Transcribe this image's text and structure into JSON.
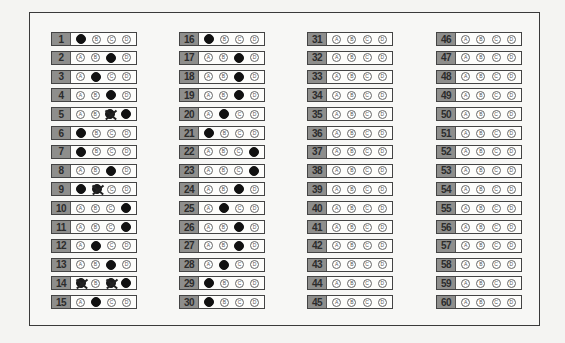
{
  "sheet": {
    "options": [
      "A",
      "B",
      "C",
      "D"
    ],
    "columns": [
      {
        "x": 51,
        "questions": [
          {
            "n": "1",
            "marks": [
              "filled",
              "",
              "",
              ""
            ]
          },
          {
            "n": "2",
            "marks": [
              "",
              "",
              "filled",
              ""
            ]
          },
          {
            "n": "3",
            "marks": [
              "",
              "filled",
              "",
              ""
            ]
          },
          {
            "n": "4",
            "marks": [
              "",
              "",
              "filled",
              ""
            ]
          },
          {
            "n": "5",
            "marks": [
              "",
              "",
              "crossed",
              "filled"
            ]
          },
          {
            "n": "6",
            "marks": [
              "filled",
              "",
              "",
              ""
            ]
          },
          {
            "n": "7",
            "marks": [
              "filled",
              "",
              "",
              ""
            ]
          },
          {
            "n": "8",
            "marks": [
              "",
              "",
              "filled",
              ""
            ]
          },
          {
            "n": "9",
            "marks": [
              "filled",
              "crossed",
              "",
              ""
            ]
          },
          {
            "n": "10",
            "marks": [
              "",
              "",
              "",
              "filled"
            ]
          },
          {
            "n": "11",
            "marks": [
              "",
              "",
              "",
              "filled"
            ]
          },
          {
            "n": "12",
            "marks": [
              "",
              "filled",
              "",
              ""
            ]
          },
          {
            "n": "13",
            "marks": [
              "",
              "",
              "filled",
              ""
            ]
          },
          {
            "n": "14",
            "marks": [
              "crossed",
              "",
              "crossed",
              "filled"
            ]
          },
          {
            "n": "15",
            "marks": [
              "",
              "filled",
              "",
              ""
            ]
          }
        ]
      },
      {
        "x": 179,
        "questions": [
          {
            "n": "16",
            "marks": [
              "filled",
              "",
              "",
              ""
            ]
          },
          {
            "n": "17",
            "marks": [
              "",
              "",
              "filled",
              ""
            ]
          },
          {
            "n": "18",
            "marks": [
              "",
              "",
              "filled",
              ""
            ]
          },
          {
            "n": "19",
            "marks": [
              "",
              "",
              "filled",
              ""
            ]
          },
          {
            "n": "20",
            "marks": [
              "",
              "filled",
              "",
              ""
            ]
          },
          {
            "n": "21",
            "marks": [
              "filled",
              "",
              "",
              ""
            ]
          },
          {
            "n": "22",
            "marks": [
              "",
              "",
              "",
              "filled"
            ]
          },
          {
            "n": "23",
            "marks": [
              "",
              "",
              "",
              "filled"
            ]
          },
          {
            "n": "24",
            "marks": [
              "",
              "",
              "filled",
              ""
            ]
          },
          {
            "n": "25",
            "marks": [
              "",
              "filled",
              "",
              ""
            ]
          },
          {
            "n": "26",
            "marks": [
              "",
              "",
              "filled",
              ""
            ]
          },
          {
            "n": "27",
            "marks": [
              "",
              "",
              "filled",
              ""
            ]
          },
          {
            "n": "28",
            "marks": [
              "",
              "filled",
              "",
              ""
            ]
          },
          {
            "n": "29",
            "marks": [
              "filled",
              "",
              "",
              ""
            ]
          },
          {
            "n": "30",
            "marks": [
              "filled",
              "",
              "",
              ""
            ]
          }
        ]
      },
      {
        "x": 307,
        "questions": [
          {
            "n": "31",
            "marks": [
              "",
              "",
              "",
              ""
            ]
          },
          {
            "n": "32",
            "marks": [
              "",
              "",
              "",
              ""
            ]
          },
          {
            "n": "33",
            "marks": [
              "",
              "",
              "",
              ""
            ]
          },
          {
            "n": "34",
            "marks": [
              "",
              "",
              "",
              ""
            ]
          },
          {
            "n": "35",
            "marks": [
              "",
              "",
              "",
              ""
            ]
          },
          {
            "n": "36",
            "marks": [
              "",
              "",
              "",
              ""
            ]
          },
          {
            "n": "37",
            "marks": [
              "",
              "",
              "",
              ""
            ]
          },
          {
            "n": "38",
            "marks": [
              "",
              "",
              "",
              ""
            ]
          },
          {
            "n": "39",
            "marks": [
              "",
              "",
              "",
              ""
            ]
          },
          {
            "n": "40",
            "marks": [
              "",
              "",
              "",
              ""
            ]
          },
          {
            "n": "41",
            "marks": [
              "",
              "",
              "",
              ""
            ]
          },
          {
            "n": "42",
            "marks": [
              "",
              "",
              "",
              ""
            ]
          },
          {
            "n": "43",
            "marks": [
              "",
              "",
              "",
              ""
            ]
          },
          {
            "n": "44",
            "marks": [
              "",
              "",
              "",
              ""
            ]
          },
          {
            "n": "45",
            "marks": [
              "",
              "",
              "",
              ""
            ]
          }
        ]
      },
      {
        "x": 436,
        "questions": [
          {
            "n": "46",
            "marks": [
              "",
              "",
              "",
              ""
            ]
          },
          {
            "n": "47",
            "marks": [
              "",
              "",
              "",
              ""
            ]
          },
          {
            "n": "48",
            "marks": [
              "",
              "",
              "",
              ""
            ]
          },
          {
            "n": "49",
            "marks": [
              "",
              "",
              "",
              ""
            ]
          },
          {
            "n": "50",
            "marks": [
              "",
              "",
              "",
              ""
            ]
          },
          {
            "n": "51",
            "marks": [
              "",
              "",
              "",
              ""
            ]
          },
          {
            "n": "52",
            "marks": [
              "",
              "",
              "",
              ""
            ]
          },
          {
            "n": "53",
            "marks": [
              "",
              "",
              "",
              ""
            ]
          },
          {
            "n": "54",
            "marks": [
              "",
              "",
              "",
              ""
            ]
          },
          {
            "n": "55",
            "marks": [
              "",
              "",
              "",
              ""
            ]
          },
          {
            "n": "56",
            "marks": [
              "",
              "",
              "",
              ""
            ]
          },
          {
            "n": "57",
            "marks": [
              "",
              "",
              "",
              ""
            ]
          },
          {
            "n": "58",
            "marks": [
              "",
              "",
              "",
              ""
            ]
          },
          {
            "n": "59",
            "marks": [
              "",
              "",
              "",
              ""
            ]
          },
          {
            "n": "60",
            "marks": [
              "",
              "",
              "",
              ""
            ]
          }
        ]
      }
    ]
  }
}
